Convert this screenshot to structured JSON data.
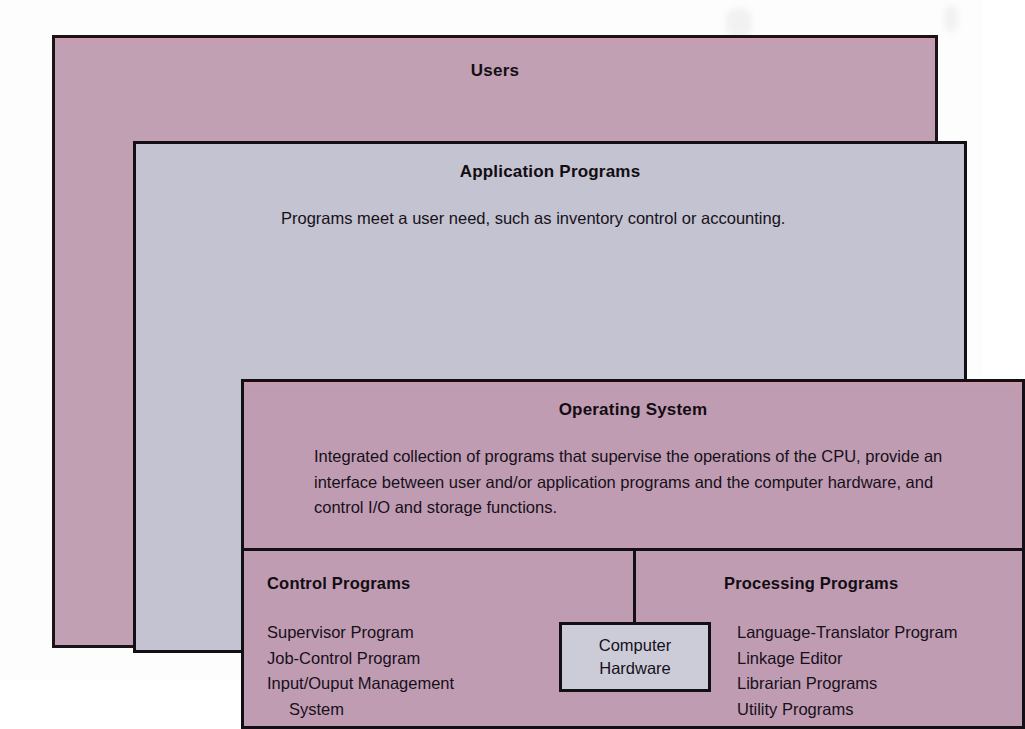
{
  "diagram": {
    "users": {
      "title": "Users"
    },
    "application_programs": {
      "title": "Application Programs",
      "description": "Programs meet a user need, such as inventory control or accounting."
    },
    "operating_system": {
      "title": "Operating System",
      "description": "Integrated collection of programs that supervise the operations of the CPU, provide an interface between user and/or application programs and the computer hardware, and control I/O and storage functions."
    },
    "control_programs": {
      "title": "Control Programs",
      "items": [
        "Supervisor Program",
        "Job-Control Program",
        "Input/Ouput Management",
        "System"
      ]
    },
    "processing_programs": {
      "title": "Processing Programs",
      "items": [
        "Language-Translator Program",
        "Linkage Editor",
        "Librarian Programs",
        "Utility Programs"
      ]
    },
    "computer_hardware": {
      "line1": "Computer",
      "line2": "Hardware"
    }
  },
  "colors": {
    "mauve": "#c1a0b4",
    "lavender_gray": "#c3c3d1",
    "os_mauve": "#c09cb2",
    "hardware_gray": "#ccccd8",
    "outline": "#140f14",
    "text": "#16101a",
    "page": "#fdfdfd"
  }
}
